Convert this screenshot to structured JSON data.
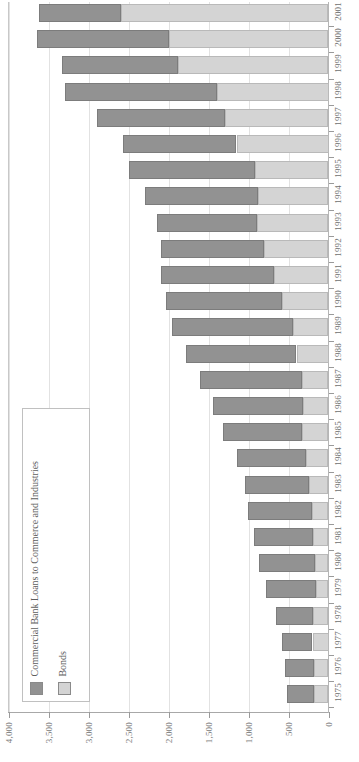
{
  "chart_data": {
    "type": "bar",
    "orientation": "horizontal-stacked",
    "title": "",
    "subtitle": "",
    "xlabel": "",
    "ylabel": "",
    "xlim": [
      0,
      4000
    ],
    "x_axis_reversed": true,
    "grid": true,
    "legend_position": "lower-left",
    "axis_tick_labels": [
      "4,000",
      "3,500",
      "3,000",
      "2,500",
      "2,000",
      "1,500",
      "1,000",
      "500",
      "0"
    ],
    "axis_tick_values": [
      4000,
      3500,
      3000,
      2500,
      2000,
      1500,
      1000,
      500,
      0
    ],
    "categories": [
      "2001",
      "2000",
      "1999",
      "1998",
      "1997",
      "1996",
      "1995",
      "1994",
      "1993",
      "1992",
      "1991",
      "1990",
      "1989",
      "1988",
      "1987",
      "1986",
      "1985",
      "1984",
      "1983",
      "1982",
      "1981",
      "1980",
      "1979",
      "1978",
      "1977",
      "1976",
      "1975"
    ],
    "series": [
      {
        "name": "Commercial Bank Loans to Commerce and Industries",
        "color": "#929292",
        "values": [
          1030,
          1650,
          1450,
          1900,
          1600,
          1420,
          1580,
          1420,
          1250,
          1290,
          1420,
          1450,
          1520,
          1380,
          1280,
          1120,
          990,
          870,
          800,
          800,
          740,
          700,
          620,
          470,
          380,
          360,
          340
        ]
      },
      {
        "name": "Bonds",
        "color": "#d4d4d4",
        "values": [
          2590,
          1990,
          1880,
          1400,
          1290,
          1150,
          920,
          880,
          890,
          810,
          680,
          580,
          440,
          400,
          330,
          320,
          330,
          280,
          240,
          210,
          190,
          170,
          160,
          190,
          200,
          180,
          180
        ]
      }
    ],
    "totals": [
      3620,
      3640,
      3330,
      3300,
      2890,
      2570,
      2500,
      2300,
      2140,
      2100,
      2100,
      2030,
      1960,
      1780,
      1610,
      1440,
      1320,
      1150,
      1040,
      1010,
      930,
      870,
      780,
      660,
      580,
      540,
      520
    ]
  },
  "legend": {
    "entries": [
      {
        "label": "Commercial Bank Loans to Commerce and Industries",
        "color": "#929292"
      },
      {
        "label": "Bonds",
        "color": "#d4d4d4"
      }
    ]
  },
  "colors": {
    "loans": "#929292",
    "bonds": "#d4d4d4",
    "grid": "#e2e2e2",
    "axis": "#a8a8a8",
    "text": "#6f6f6f",
    "background": "#ffffff"
  }
}
